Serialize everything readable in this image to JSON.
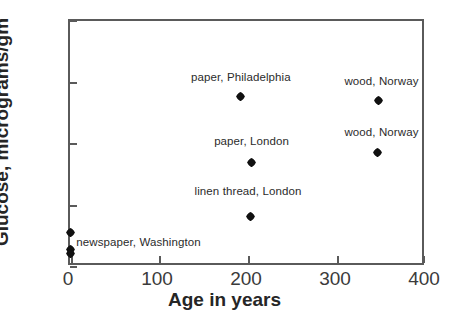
{
  "chart_data": {
    "type": "scatter",
    "title": "",
    "xlabel": "Age in years",
    "ylabel": "Glucose, micrograms/gm",
    "xlim": [
      0,
      400
    ],
    "ylim": [
      0,
      200
    ],
    "xticks": [
      0,
      100,
      200,
      300,
      400
    ],
    "yticks": [
      0,
      50,
      100,
      150,
      200
    ],
    "xtick_labels": [
      "0",
      "100",
      "200",
      "300",
      "400"
    ],
    "ytick_labels": [
      "0",
      "50",
      "100",
      "150",
      "200"
    ],
    "grid": false,
    "legend": "none",
    "marker": "filled-diamond",
    "marker_color": "#111111",
    "points": [
      {
        "id": "p1",
        "x": 0,
        "y": 28,
        "label": ""
      },
      {
        "id": "p2",
        "x": 0,
        "y": 14,
        "label": ""
      },
      {
        "id": "p3",
        "x": 0,
        "y": 11,
        "label": "newspaper, Washington"
      },
      {
        "id": "p4",
        "x": 192,
        "y": 139,
        "label": "paper, Philadelphia"
      },
      {
        "id": "p5",
        "x": 204,
        "y": 85,
        "label": "paper, London"
      },
      {
        "id": "p6",
        "x": 203,
        "y": 41,
        "label": "linen thread, London"
      },
      {
        "id": "p7",
        "x": 347,
        "y": 135,
        "label": "wood, Norway"
      },
      {
        "id": "p8",
        "x": 345,
        "y": 93,
        "label": "wood, Norway"
      }
    ],
    "annotations": [
      {
        "text": "paper, Philadelphia",
        "x": 192,
        "y": 153
      },
      {
        "text": "wood, Norway",
        "x": 350,
        "y": 150
      },
      {
        "text": "paper, London",
        "x": 204,
        "y": 101
      },
      {
        "text": "wood, Norway",
        "x": 350,
        "y": 108
      },
      {
        "text": "linen thread, London",
        "x": 200,
        "y": 60
      },
      {
        "text": "newspaper, Washington",
        "x": 77,
        "y": 19
      }
    ]
  },
  "axis": {
    "x_title": "Age in years",
    "y_title": "Glucose, micrograms/gm"
  }
}
